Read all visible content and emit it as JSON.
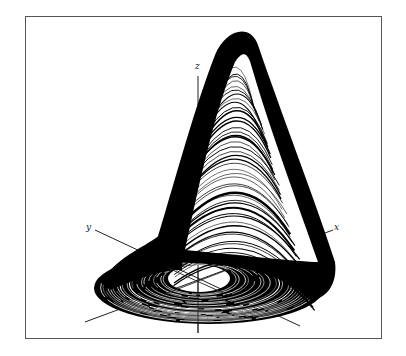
{
  "figure": {
    "title": "",
    "frame": {
      "left": 25,
      "top": 16,
      "right": 382,
      "bottom": 339,
      "color": "#555555"
    },
    "ink_color": "#000000",
    "background": "#ffffff"
  },
  "axes": {
    "x": {
      "label": "x",
      "label_pos": [
        334,
        226
      ]
    },
    "y": {
      "label": "y",
      "label_pos": [
        86,
        226
      ]
    },
    "z": {
      "label": "z",
      "label_pos": [
        195,
        64
      ]
    }
  },
  "attractor": {
    "peak": [
      238,
      27
    ],
    "hole_center": [
      198,
      282
    ],
    "ring_outer": {
      "left": 100,
      "right": 330,
      "top": 250,
      "bottom": 322
    },
    "hole": {
      "left": 168,
      "right": 230,
      "top": 265,
      "bottom": 292
    },
    "band_strokes": 46,
    "ring_strokes": 28
  }
}
